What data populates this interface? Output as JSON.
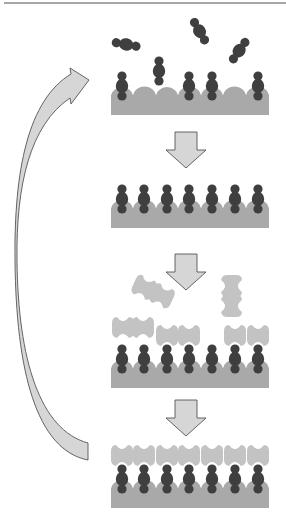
{
  "diagram": {
    "colors": {
      "background": "#ffffff",
      "top_rule": "#8a8a8a",
      "substrate": "#a9a9a9",
      "molecule": "#3f3f3f",
      "receptor": "#c3c3c3",
      "arrow_fill": "#d6d6d6",
      "arrow_stroke": "#555555"
    },
    "steps": [
      {
        "id": "step-1",
        "label": "Partial adsorption of molecules onto substrate",
        "substrate_sites": 7,
        "bound_sites": [
          0,
          3,
          4,
          6
        ],
        "approaching_molecules": 1,
        "free_molecules": 4
      },
      {
        "id": "step-2",
        "label": "Fully covered monolayer",
        "substrate_sites": 7,
        "bound_sites": [
          0,
          1,
          2,
          3,
          4,
          5,
          6
        ]
      },
      {
        "id": "step-3",
        "label": "Receptor binding in progress",
        "substrate_sites": 7,
        "bound_sites": [
          0,
          1,
          2,
          3,
          4,
          5,
          6
        ],
        "receptor_capped_sites": [
          2,
          3,
          5,
          6
        ],
        "receptor_hovering_sites": [
          0,
          1
        ],
        "free_receptors": 2
      },
      {
        "id": "step-4",
        "label": "Fully capped surface",
        "substrate_sites": 7,
        "bound_sites": [
          0,
          1,
          2,
          3,
          4,
          5,
          6
        ],
        "receptor_capped_sites": [
          0,
          1,
          2,
          3,
          4,
          5,
          6
        ]
      }
    ],
    "arrows": [
      {
        "id": "arrow-step1-to-step2",
        "type": "down"
      },
      {
        "id": "arrow-step2-to-step3",
        "type": "down"
      },
      {
        "id": "arrow-step3-to-step4",
        "type": "down"
      },
      {
        "id": "arrow-cycle-return",
        "type": "curved",
        "from": "step-4",
        "to": "step-1"
      }
    ]
  }
}
